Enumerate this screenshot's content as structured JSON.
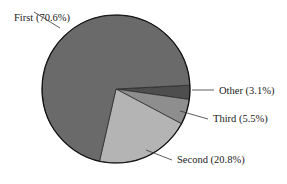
{
  "chart_data": {
    "type": "pie",
    "title": "",
    "categories": [
      "First",
      "Second",
      "Third",
      "Other"
    ],
    "values": [
      70.6,
      20.8,
      5.5,
      3.1
    ],
    "labels": [
      "First (70.6%)",
      "Second (20.8%)",
      "Third (5.5%)",
      "Other (3.1%)"
    ],
    "colors": [
      "#6a6a6a",
      "#b4b4b4",
      "#8e8e8e",
      "#4e4e4e"
    ],
    "legend": "none (callout labels with leader lines)",
    "unit": "%"
  },
  "slices": [
    {
      "name": "Other",
      "label": "Other (3.1%)",
      "value": 3.1,
      "color": "#4e4e4e"
    },
    {
      "name": "Third",
      "label": "Third (5.5%)",
      "value": 5.5,
      "color": "#8e8e8e"
    },
    {
      "name": "Second",
      "label": "Second (20.8%)",
      "value": 20.8,
      "color": "#b4b4b4"
    },
    {
      "name": "First",
      "label": "First (70.6%)",
      "value": 70.6,
      "color": "#6a6a6a"
    }
  ]
}
